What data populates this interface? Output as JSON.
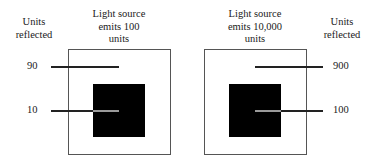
{
  "diagram": {
    "left_panel": {
      "axis_label": "Units reflected",
      "axis_label_lines": [
        "Units",
        "reflected"
      ],
      "source_label_lines": [
        "Light source",
        "emits 100",
        "units"
      ],
      "source_units": 100,
      "values": [
        {
          "label": "90",
          "region": "white surround",
          "units_reflected": 90
        },
        {
          "label": "10",
          "region": "black square",
          "units_reflected": 10
        }
      ]
    },
    "right_panel": {
      "axis_label": "Units reflected",
      "axis_label_lines": [
        "Units",
        "reflected"
      ],
      "source_label_lines": [
        "Light source",
        "emits 10,000",
        "units"
      ],
      "source_units": 10000,
      "values": [
        {
          "label": "900",
          "region": "white surround",
          "units_reflected": 900
        },
        {
          "label": "100",
          "region": "black square",
          "units_reflected": 100
        }
      ]
    },
    "colors": {
      "outer_box_border": "#555555",
      "inner_square": "#000000",
      "leader_line": "#222222",
      "leader_line_on_black": "#9a9a9a"
    }
  }
}
